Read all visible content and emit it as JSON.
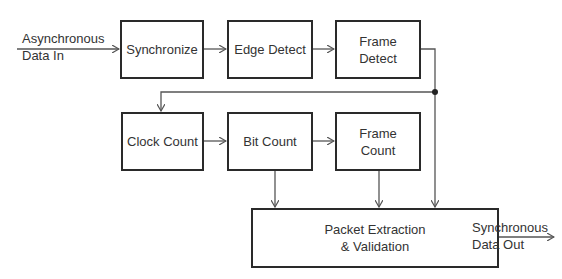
{
  "diagram": {
    "type": "block-diagram",
    "blocks": [
      {
        "id": "synchronize",
        "label": "Synchronize"
      },
      {
        "id": "edge_detect",
        "label": "Edge Detect"
      },
      {
        "id": "frame_detect",
        "label": "Frame Detect",
        "line1": "Frame",
        "line2": "Detect"
      },
      {
        "id": "clock_count",
        "label": "Clock Count"
      },
      {
        "id": "bit_count",
        "label": "Bit Count"
      },
      {
        "id": "frame_count",
        "label": "Frame Count",
        "line1": "Frame",
        "line2": "Count"
      },
      {
        "id": "packet",
        "label": "Packet Extraction & Validation",
        "line1": "Packet Extraction",
        "line2": "& Validation"
      }
    ],
    "input": {
      "line1": "Asynchronous",
      "line2": "Data In"
    },
    "output": {
      "line1": "Synchronous",
      "line2": "Data Out"
    },
    "edges": [
      {
        "from": "input",
        "to": "synchronize"
      },
      {
        "from": "synchronize",
        "to": "edge_detect"
      },
      {
        "from": "edge_detect",
        "to": "frame_detect"
      },
      {
        "from": "frame_detect",
        "to": "clock_count"
      },
      {
        "from": "frame_detect",
        "to": "packet"
      },
      {
        "from": "clock_count",
        "to": "bit_count"
      },
      {
        "from": "bit_count",
        "to": "frame_count"
      },
      {
        "from": "bit_count",
        "to": "packet"
      },
      {
        "from": "frame_count",
        "to": "packet"
      },
      {
        "from": "packet",
        "to": "output"
      }
    ],
    "colors": {
      "line": "#555555",
      "border": "#2a2a2a",
      "text": "#333333"
    }
  }
}
